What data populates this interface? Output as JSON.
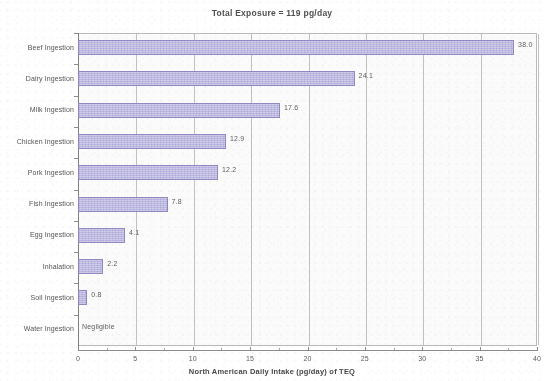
{
  "chart_data": {
    "type": "bar",
    "orientation": "horizontal",
    "title": "Total Exposure = 119 pg/day",
    "xlabel": "North American Daily Intake (pg/day) of TEQ",
    "ylabel": "",
    "xlim": [
      0,
      40
    ],
    "xticks": [
      0,
      5,
      10,
      15,
      20,
      25,
      30,
      35,
      40
    ],
    "xtick_labels": [
      "0",
      "5",
      "10",
      "15",
      "20",
      "25",
      "30",
      "35",
      "40"
    ],
    "grid": true,
    "legend": null,
    "bar_color": "#bcb8e4",
    "bar_border_color": "#8d86c4",
    "categories": [
      "Beef Ingestion",
      "Dairy Ingestion",
      "Milk Ingestion",
      "Chicken Ingestion",
      "Pork Ingestion",
      "Fish Ingestion",
      "Egg Ingestion",
      "Inhalation",
      "Soil Ingestion",
      "Water Ingestion"
    ],
    "values": [
      38.0,
      24.1,
      17.6,
      12.9,
      12.2,
      7.8,
      4.1,
      2.2,
      0.8,
      0
    ],
    "data_labels": [
      "38.0",
      "24.1",
      "17.6",
      "12.9",
      "12.2",
      "7.8",
      "4.1",
      "2.2",
      "0.8",
      "Negligible"
    ]
  }
}
